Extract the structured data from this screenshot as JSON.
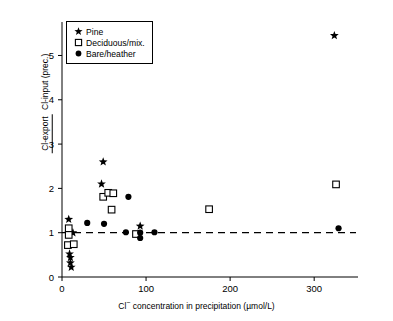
{
  "axes": {
    "x": {
      "label_prefix": "Cl",
      "label_sup": "−",
      "label_rest": " concentration in precipitation (µmol/L)",
      "ticks": [
        0,
        100,
        200,
        300
      ],
      "min": 0,
      "max": 345
    },
    "y": {
      "label_numerator": "Cl-export",
      "label_denominator": "Cl-input (prec.)",
      "ticks": [
        0,
        1,
        2,
        3,
        4,
        5
      ],
      "min": 0,
      "max": 5.62
    }
  },
  "legend": {
    "items": [
      {
        "label": "Pine",
        "glyph": "star-marker",
        "color": "#000000"
      },
      {
        "label": "Deciduous/mix.",
        "glyph": "open-square-marker",
        "color": "#000000"
      },
      {
        "label": "Bare/heather",
        "glyph": "filled-circle-marker",
        "color": "#000000"
      }
    ]
  },
  "reference_line": {
    "y": 1,
    "style": "dashed"
  },
  "chart_data": {
    "type": "scatter",
    "title": "",
    "xlabel": "Cl− concentration in precipitation (µmol/L)",
    "ylabel": "Cl-export / Cl-input (prec.)",
    "xlim": [
      0,
      345
    ],
    "ylim": [
      0,
      5.62
    ],
    "grid": false,
    "legend_position": "top-left",
    "annotations": [
      {
        "type": "hline",
        "y": 1,
        "style": "dashed",
        "label": "ratio = 1"
      }
    ],
    "series": [
      {
        "name": "Pine",
        "marker": "star",
        "filled": true,
        "points": [
          {
            "x": 8,
            "y": 1.3
          },
          {
            "x": 13,
            "y": 1.0
          },
          {
            "x": 9,
            "y": 0.52
          },
          {
            "x": 10,
            "y": 0.44
          },
          {
            "x": 10,
            "y": 0.32
          },
          {
            "x": 11,
            "y": 0.22
          },
          {
            "x": 49,
            "y": 2.6
          },
          {
            "x": 47,
            "y": 2.1
          },
          {
            "x": 93,
            "y": 1.15
          },
          {
            "x": 324,
            "y": 5.45
          }
        ]
      },
      {
        "name": "Deciduous/mix.",
        "marker": "square",
        "filled": false,
        "points": [
          {
            "x": 8,
            "y": 1.1
          },
          {
            "x": 8,
            "y": 0.95
          },
          {
            "x": 7,
            "y": 0.72
          },
          {
            "x": 14,
            "y": 0.74
          },
          {
            "x": 49,
            "y": 1.81
          },
          {
            "x": 55,
            "y": 1.9
          },
          {
            "x": 61,
            "y": 1.89
          },
          {
            "x": 59,
            "y": 1.52
          },
          {
            "x": 88,
            "y": 0.97
          },
          {
            "x": 175,
            "y": 1.53
          },
          {
            "x": 326,
            "y": 2.09
          }
        ]
      },
      {
        "name": "Bare/heather",
        "marker": "circle",
        "filled": true,
        "points": [
          {
            "x": 30,
            "y": 1.22
          },
          {
            "x": 50,
            "y": 1.2
          },
          {
            "x": 79,
            "y": 1.81
          },
          {
            "x": 76,
            "y": 1.01
          },
          {
            "x": 93,
            "y": 1.0
          },
          {
            "x": 93,
            "y": 0.88
          },
          {
            "x": 110,
            "y": 1.01
          },
          {
            "x": 329,
            "y": 1.1
          }
        ]
      }
    ]
  }
}
